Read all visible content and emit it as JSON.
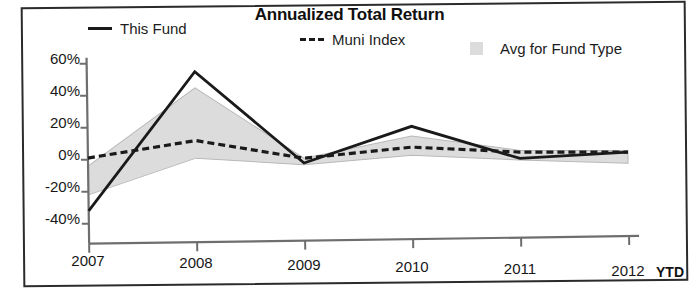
{
  "chart_data": {
    "type": "line",
    "title": "Annualized Total Return",
    "xlabel": "",
    "ylabel": "",
    "categories": [
      "2007",
      "2008",
      "2009",
      "2010",
      "2011",
      "2012"
    ],
    "x_axis_suffix": "YTD",
    "ylim": [
      -40,
      60
    ],
    "ytick_labels": [
      "60%",
      "40%",
      "20%",
      "0%",
      "-20%",
      "-40%"
    ],
    "ytick_values": [
      60,
      40,
      20,
      0,
      -20,
      -40
    ],
    "grid": false,
    "legend_position": "top",
    "series": [
      {
        "name": "This Fund",
        "style": "solid",
        "color": "#1a1a1a",
        "values": [
          -32,
          54,
          -4,
          18,
          -3,
          0
        ]
      },
      {
        "name": "Muni Index",
        "style": "dashed",
        "color": "#1a1a1a",
        "values": [
          1,
          11,
          -1,
          5,
          1,
          0
        ]
      },
      {
        "name": "Avg for Fund Type",
        "style": "band",
        "color": "#dcdcdc",
        "band_upper": [
          -4,
          44,
          -1,
          12,
          2,
          1
        ],
        "band_lower": [
          -22,
          0,
          -5,
          0,
          -4,
          -7
        ]
      }
    ]
  },
  "legend": {
    "items": [
      {
        "label": "This Fund",
        "marker": "solid-line-icon"
      },
      {
        "label": "Muni Index",
        "marker": "dashed-line-icon"
      },
      {
        "label": "Avg for Fund Type",
        "marker": "gray-swatch-icon"
      }
    ]
  },
  "colors": {
    "line": "#1a1a1a",
    "band": "#dcdcdc",
    "axis": "#6e6e6e",
    "frame": "#2b2b2b"
  }
}
